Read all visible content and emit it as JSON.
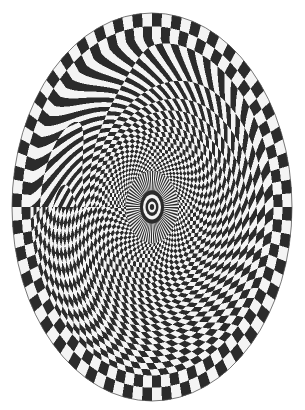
{
  "image": {
    "title": "Elliptical spiral checkerboard optical illusion",
    "width": 305,
    "height": 410,
    "background": "#ffffff"
  },
  "pattern": {
    "type": "log-polar-checkerboard",
    "center": [
      152,
      207
    ],
    "radii": [
      140,
      194
    ],
    "sectors": 88,
    "twist": 0.55,
    "dark_color": "#2b2b2b",
    "light_color": "#f4f4f4",
    "outline_color": "#555555",
    "core": {
      "spoke_radius": 26,
      "spokes": 64,
      "rings": [
        {
          "r": 12,
          "color": "#2b2b2b"
        },
        {
          "r": 9,
          "color": "#f4f4f4"
        },
        {
          "r": 6.5,
          "color": "#2b2b2b"
        },
        {
          "r": 4,
          "color": "#f4f4f4"
        },
        {
          "r": 2.2,
          "color": "#2b2b2b"
        }
      ]
    }
  }
}
